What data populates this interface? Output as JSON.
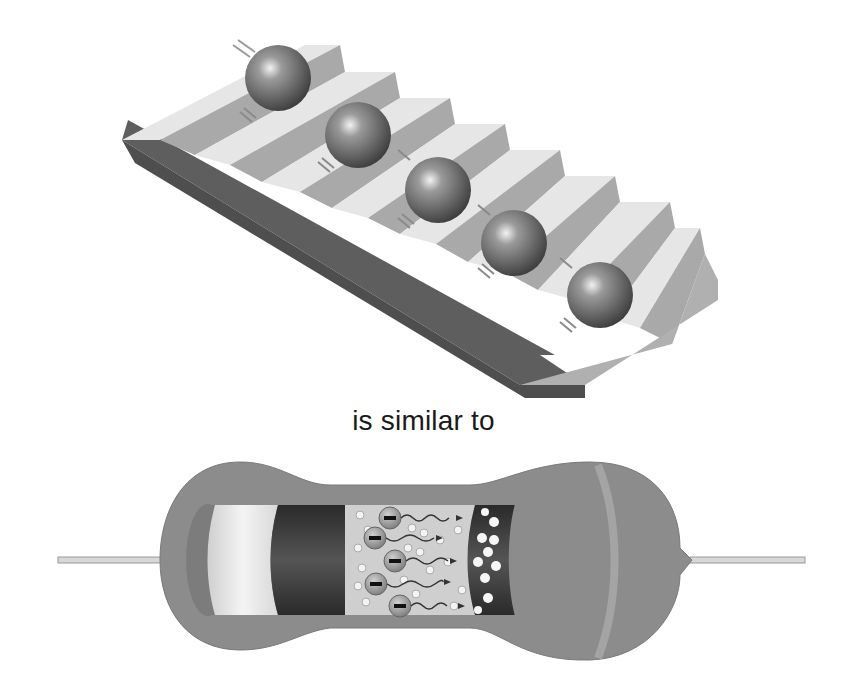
{
  "figure": {
    "top_panel": {
      "name": "staircase-with-balls",
      "description": "Balls rolling down a staircase, one per step",
      "ball_count": 5,
      "step_count": 9
    },
    "caption": "is similar to",
    "bottom_panel": {
      "name": "resistor-cutaway",
      "description": "Cutaway of a resistor showing electrons moving through resistive material",
      "electron_symbol": "−",
      "electron_count": 5
    },
    "colors": {
      "background": "#ffffff",
      "step_top": "#e2e2e2",
      "step_riser": "#a8a8a8",
      "slab_side": "#5e5e5e",
      "ball": "#6e6e6e",
      "resistor_body": "#8c8c8c",
      "text": "#1a1a1a"
    }
  }
}
